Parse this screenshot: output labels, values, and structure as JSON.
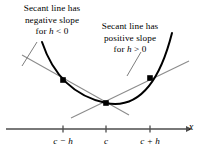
{
  "figure": {
    "background_color": "#ffffff",
    "curve_color": "#000000",
    "secant_color": "#8c8c8c",
    "axis_color": "#4d4d4d",
    "point_color": "#000000"
  },
  "annotations": {
    "negative": {
      "line1": "Secant line has",
      "line2": "negative slope",
      "line3_prefix": "for ",
      "line3_var": "h",
      "line3_suffix": " < 0"
    },
    "positive": {
      "line1": "Secant line has",
      "line2": "positive slope",
      "line3_prefix": "for ",
      "line3_var": "h",
      "line3_suffix": " > 0"
    }
  },
  "axis": {
    "name": "x",
    "ticks": [
      {
        "label_prefix": "c",
        "label_suffix": " − h",
        "x": 63
      },
      {
        "label_prefix": "c",
        "label_suffix": "",
        "x": 106
      },
      {
        "label_prefix": "c",
        "label_suffix": " + h",
        "x": 150
      }
    ],
    "tick_labels": {
      "left": "c − h",
      "center": "c",
      "right": "c + h"
    }
  },
  "chart_data": {
    "type": "line",
    "xlabel": "x",
    "ylabel": "",
    "grid": false,
    "legend": null,
    "curves": [
      {
        "name": "parabola",
        "style": "solid",
        "color": "#000000",
        "width": 2.0,
        "path": "M 42,42 Q 59,93 106,103 Q 152,112 172,33"
      },
      {
        "name": "secant-negative-slope",
        "style": "solid",
        "color": "#8c8c8c",
        "width": 1.1,
        "x1": 22,
        "y1": 55,
        "x2": 129,
        "y2": 115
      },
      {
        "name": "secant-positive-slope",
        "style": "solid",
        "color": "#8c8c8c",
        "width": 1.1,
        "x1": 71,
        "y1": 118,
        "x2": 189,
        "y2": 61
      }
    ],
    "points": [
      {
        "name": "point-c-minus-h",
        "x": 63,
        "y": 80,
        "tick": "c − h"
      },
      {
        "name": "point-c",
        "x": 106,
        "y": 103,
        "tick": "c"
      },
      {
        "name": "point-c-plus-h",
        "x": 150,
        "y": 78,
        "tick": "c + h"
      }
    ],
    "leaders": [
      {
        "name": "leader-negative",
        "x1": 37,
        "y1": 42,
        "x2": 22,
        "y2": 66
      },
      {
        "name": "leader-positive",
        "x1": 141,
        "y1": 52,
        "x2": 127,
        "y2": 76
      }
    ],
    "axis_line": {
      "x1": 6,
      "y1": 129,
      "x2": 186,
      "y2": 129
    },
    "tick_height": 7
  }
}
